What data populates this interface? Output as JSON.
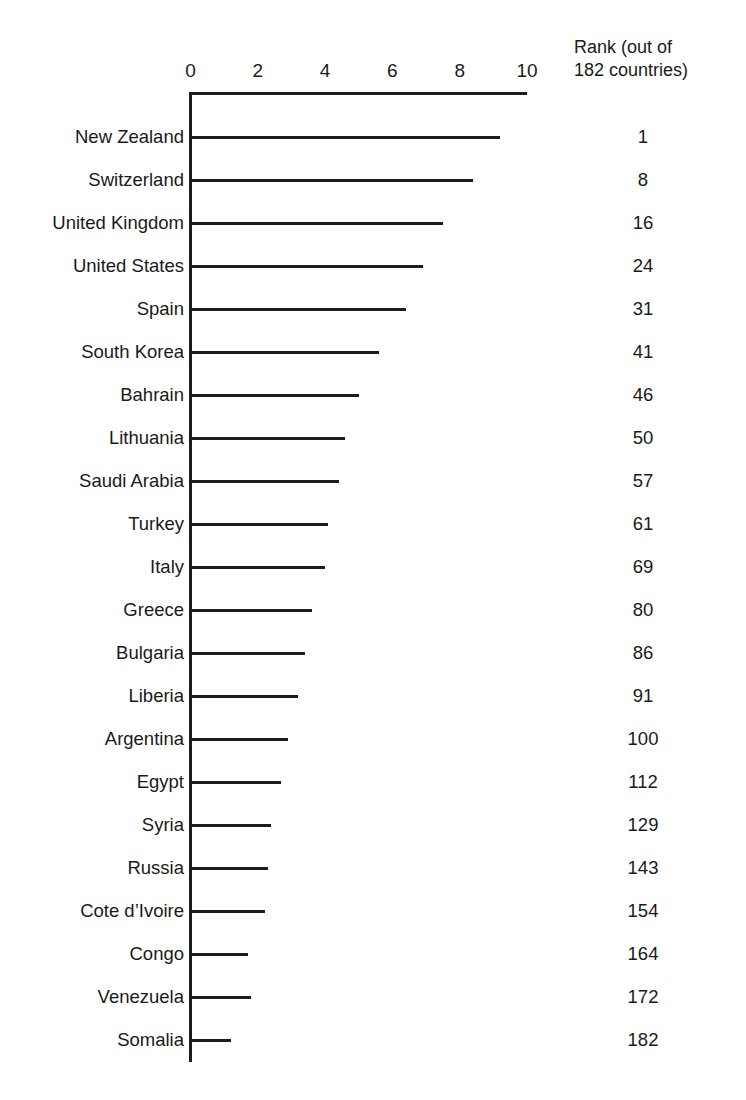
{
  "chart_data": {
    "type": "bar",
    "orientation": "horizontal",
    "title": "",
    "subtitle": "",
    "xlabel": "",
    "ylabel": "",
    "xlim": [
      0,
      10
    ],
    "xticks": [
      0,
      2,
      4,
      6,
      8,
      10
    ],
    "xtick_labels": [
      "0",
      "2",
      "4",
      "6",
      "8",
      "10"
    ],
    "grid": false,
    "legend": null,
    "bar_style": "thin-line",
    "bar_color": "#1c1c1c",
    "categories": [
      "New Zealand",
      "Switzerland",
      "United Kingdom",
      "United States",
      "Spain",
      "South Korea",
      "Bahrain",
      "Lithuania",
      "Saudi Arabia",
      "Turkey",
      "Italy",
      "Greece",
      "Bulgaria",
      "Liberia",
      "Argentina",
      "Egypt",
      "Syria",
      "Russia",
      "Cote d’Ivoire",
      "Congo",
      "Venezuela",
      "Somalia"
    ],
    "values": [
      9.2,
      8.4,
      7.5,
      6.9,
      6.4,
      5.6,
      5.0,
      4.6,
      4.4,
      4.1,
      4.0,
      3.6,
      3.4,
      3.2,
      2.9,
      2.7,
      2.4,
      2.3,
      2.2,
      1.7,
      1.8,
      1.2
    ],
    "series": [
      {
        "name": "Score",
        "values": [
          9.2,
          8.4,
          7.5,
          6.9,
          6.4,
          5.6,
          5.0,
          4.6,
          4.4,
          4.1,
          4.0,
          3.6,
          3.4,
          3.2,
          2.9,
          2.7,
          2.4,
          2.3,
          2.2,
          1.7,
          1.8,
          1.2
        ]
      }
    ],
    "annotation_column": {
      "header_line_1": "Rank (out of",
      "header_line_2": "182 countries)",
      "values": [
        "1",
        "8",
        "16",
        "24",
        "31",
        "41",
        "46",
        "50",
        "57",
        "61",
        "69",
        "80",
        "86",
        "91",
        "100",
        "112",
        "129",
        "143",
        "154",
        "164",
        "172",
        "182"
      ]
    }
  }
}
